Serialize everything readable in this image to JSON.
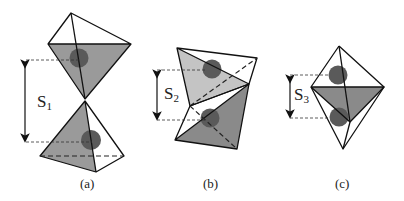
{
  "figure": {
    "panels": [
      {
        "id": "a",
        "caption": "(a)",
        "distance_label": "S",
        "distance_subscript": "1"
      },
      {
        "id": "b",
        "caption": "(b)",
        "distance_label": "S",
        "distance_subscript": "2"
      },
      {
        "id": "c",
        "caption": "(c)",
        "distance_label": "S",
        "distance_subscript": "3"
      }
    ],
    "colors": {
      "face_gray": "#9a9a9a",
      "face_light": "#c4c4c4",
      "face_dark": "#8a8a8a",
      "ball": "#5a5a5a",
      "edge": "#111111"
    }
  }
}
